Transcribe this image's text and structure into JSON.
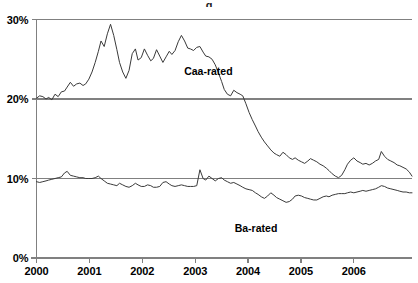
{
  "chart_data": {
    "type": "line",
    "title": "",
    "title_clipped": "g",
    "xlabel": "",
    "ylabel": "",
    "ylim": [
      0,
      30
    ],
    "yticks": [
      0,
      10,
      20,
      30
    ],
    "ytick_labels": [
      "0%",
      "10%",
      "20%",
      "30%"
    ],
    "xlim": [
      2000.0,
      2007.1
    ],
    "xticks": [
      2000,
      2001,
      2002,
      2003,
      2004,
      2005,
      2006
    ],
    "xtick_labels": [
      "2000",
      "2001",
      "2002",
      "2003",
      "2004",
      "2005",
      "2006"
    ],
    "grid": "horizontal-at-10-and-20",
    "legend_position": "inline-annotations",
    "line_color": "#3a3a3a",
    "axis_color": "#808080",
    "series": [
      {
        "name": "Caa-rated",
        "label": "Caa-rated",
        "label_x": 2003.25,
        "label_y": 23.5,
        "x": [
          2000.0,
          2000.06,
          2000.12,
          2000.18,
          2000.23,
          2000.29,
          2000.35,
          2000.41,
          2000.47,
          2000.53,
          2000.58,
          2000.64,
          2000.7,
          2000.76,
          2000.82,
          2000.88,
          2000.93,
          2000.99,
          2001.05,
          2001.11,
          2001.17,
          2001.22,
          2001.28,
          2001.34,
          2001.4,
          2001.46,
          2001.52,
          2001.57,
          2001.63,
          2001.69,
          2001.75,
          2001.81,
          2001.87,
          2001.92,
          2001.98,
          2002.04,
          2002.1,
          2002.16,
          2002.21,
          2002.27,
          2002.33,
          2002.39,
          2002.45,
          2002.51,
          2002.56,
          2002.62,
          2002.68,
          2002.74,
          2002.8,
          2002.86,
          2002.91,
          2002.97,
          2003.03,
          2003.09,
          2003.15,
          2003.2,
          2003.26,
          2003.32,
          2003.38,
          2003.44,
          2003.5,
          2003.55,
          2003.61,
          2003.67,
          2003.73,
          2003.79,
          2003.85,
          2003.9,
          2003.96,
          2004.02,
          2004.08,
          2004.14,
          2004.19,
          2004.25,
          2004.31,
          2004.37,
          2004.43,
          2004.49,
          2004.54,
          2004.6,
          2004.66,
          2004.72,
          2004.78,
          2004.84,
          2004.89,
          2004.95,
          2005.01,
          2005.07,
          2005.13,
          2005.18,
          2005.24,
          2005.3,
          2005.36,
          2005.42,
          2005.48,
          2005.53,
          2005.59,
          2005.65,
          2005.71,
          2005.77,
          2005.83,
          2005.88,
          2005.94,
          2006.0,
          2006.06,
          2006.12,
          2006.17,
          2006.23,
          2006.29,
          2006.35,
          2006.41,
          2006.47,
          2006.52,
          2006.58,
          2006.64,
          2006.7,
          2006.76,
          2006.82,
          2006.87,
          2006.93,
          2006.99,
          2007.05,
          2007.1
        ],
        "y": [
          20.1,
          20.4,
          20.3,
          20.0,
          20.2,
          19.9,
          20.6,
          20.3,
          20.9,
          21.0,
          21.5,
          22.1,
          21.6,
          21.9,
          22.0,
          21.7,
          21.9,
          22.5,
          23.4,
          24.6,
          26.0,
          27.3,
          26.6,
          28.2,
          29.4,
          28.0,
          26.2,
          24.6,
          23.4,
          22.6,
          23.6,
          25.7,
          26.3,
          24.9,
          25.2,
          26.3,
          25.5,
          24.8,
          25.1,
          26.2,
          25.4,
          24.6,
          25.3,
          26.0,
          25.6,
          26.1,
          27.2,
          28.0,
          27.3,
          26.4,
          26.3,
          26.1,
          26.5,
          26.6,
          25.9,
          25.4,
          25.3,
          25.0,
          24.3,
          23.3,
          22.2,
          21.2,
          20.6,
          20.4,
          21.1,
          20.8,
          20.6,
          20.4,
          19.4,
          18.3,
          17.4,
          16.6,
          15.9,
          15.2,
          14.6,
          14.1,
          13.6,
          13.2,
          13.0,
          12.8,
          13.3,
          13.0,
          12.6,
          12.4,
          12.6,
          12.3,
          12.1,
          11.9,
          12.2,
          12.5,
          12.3,
          12.1,
          11.8,
          11.6,
          11.3,
          11.0,
          10.6,
          10.3,
          10.1,
          10.4,
          11.1,
          11.8,
          12.3,
          12.6,
          12.2,
          12.0,
          11.8,
          11.9,
          11.7,
          11.9,
          12.2,
          12.4,
          13.4,
          12.8,
          12.4,
          12.2,
          12.0,
          11.7,
          11.6,
          11.4,
          11.2,
          10.8,
          10.3
        ]
      },
      {
        "name": "Ba-rated",
        "label": "Ba-rated",
        "label_x": 2004.15,
        "label_y": 3.75,
        "x": [
          2000.0,
          2000.06,
          2000.12,
          2000.18,
          2000.23,
          2000.29,
          2000.35,
          2000.41,
          2000.47,
          2000.53,
          2000.58,
          2000.64,
          2000.7,
          2000.76,
          2000.82,
          2000.88,
          2000.93,
          2000.99,
          2001.05,
          2001.11,
          2001.17,
          2001.22,
          2001.28,
          2001.34,
          2001.4,
          2001.46,
          2001.52,
          2001.57,
          2001.63,
          2001.69,
          2001.75,
          2001.81,
          2001.87,
          2001.92,
          2001.98,
          2002.04,
          2002.1,
          2002.16,
          2002.21,
          2002.27,
          2002.33,
          2002.39,
          2002.45,
          2002.51,
          2002.56,
          2002.62,
          2002.68,
          2002.74,
          2002.8,
          2002.86,
          2002.91,
          2002.97,
          2003.03,
          2003.09,
          2003.15,
          2003.2,
          2003.26,
          2003.32,
          2003.38,
          2003.44,
          2003.5,
          2003.55,
          2003.61,
          2003.67,
          2003.73,
          2003.79,
          2003.85,
          2003.9,
          2003.96,
          2004.02,
          2004.08,
          2004.14,
          2004.19,
          2004.25,
          2004.31,
          2004.37,
          2004.43,
          2004.49,
          2004.54,
          2004.6,
          2004.66,
          2004.72,
          2004.78,
          2004.84,
          2004.89,
          2004.95,
          2005.01,
          2005.07,
          2005.13,
          2005.18,
          2005.24,
          2005.3,
          2005.36,
          2005.42,
          2005.48,
          2005.53,
          2005.59,
          2005.65,
          2005.71,
          2005.77,
          2005.83,
          2005.88,
          2005.94,
          2006.0,
          2006.06,
          2006.12,
          2006.17,
          2006.23,
          2006.29,
          2006.35,
          2006.41,
          2006.47,
          2006.52,
          2006.58,
          2006.64,
          2006.7,
          2006.76,
          2006.82,
          2006.87,
          2006.93,
          2006.99,
          2007.05,
          2007.1
        ],
        "y": [
          9.6,
          9.5,
          9.6,
          9.7,
          9.8,
          9.9,
          10.0,
          10.1,
          10.2,
          10.7,
          10.9,
          10.4,
          10.3,
          10.2,
          10.1,
          10.1,
          10.0,
          10.0,
          10.0,
          10.1,
          10.3,
          10.0,
          9.7,
          9.4,
          9.3,
          9.2,
          9.1,
          9.4,
          9.2,
          9.0,
          8.9,
          9.1,
          9.4,
          9.2,
          9.0,
          9.0,
          9.2,
          9.1,
          8.9,
          8.9,
          9.0,
          9.5,
          9.6,
          9.3,
          9.1,
          9.0,
          9.1,
          9.2,
          9.1,
          9.0,
          9.0,
          9.0,
          9.1,
          11.1,
          10.0,
          9.8,
          10.3,
          10.0,
          9.7,
          10.0,
          10.1,
          9.8,
          9.6,
          9.4,
          9.5,
          9.3,
          9.1,
          8.9,
          8.7,
          8.6,
          8.5,
          8.2,
          8.0,
          7.7,
          7.5,
          7.8,
          8.2,
          7.9,
          7.6,
          7.4,
          7.2,
          7.0,
          7.1,
          7.4,
          7.8,
          7.9,
          7.8,
          7.6,
          7.5,
          7.4,
          7.3,
          7.3,
          7.5,
          7.7,
          7.8,
          7.7,
          7.9,
          8.0,
          8.1,
          8.1,
          8.1,
          8.2,
          8.3,
          8.2,
          8.3,
          8.4,
          8.5,
          8.4,
          8.5,
          8.6,
          8.7,
          8.9,
          9.1,
          9.0,
          8.8,
          8.7,
          8.6,
          8.5,
          8.4,
          8.3,
          8.3,
          8.2,
          8.2
        ]
      }
    ]
  },
  "axes": {
    "y_labels": [
      "30%",
      "20%",
      "10%",
      "0%"
    ],
    "x_labels": [
      "2000",
      "2001",
      "2002",
      "2003",
      "2004",
      "2005",
      "2006"
    ]
  }
}
